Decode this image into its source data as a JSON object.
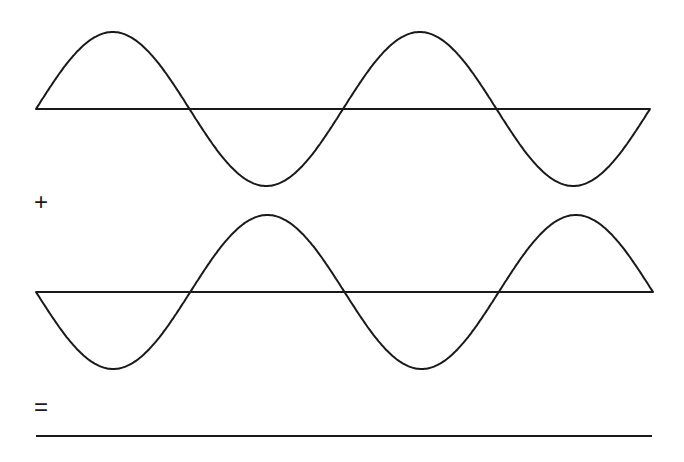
{
  "diagram": {
    "operators": {
      "plus": "+",
      "equals": "="
    },
    "wave1": {
      "label": "wave-in-phase",
      "axis_y": 109,
      "x_start": 36,
      "x_end": 650,
      "amplitude": 77,
      "cycles": 2,
      "phase": "positive"
    },
    "wave2": {
      "label": "wave-inverted",
      "axis_y": 292,
      "x_start": 36,
      "x_end": 653,
      "amplitude": 77,
      "cycles": 2,
      "phase": "negative"
    },
    "result": {
      "label": "flat-line-sum",
      "y": 436,
      "x_start": 36,
      "x_end": 652
    },
    "colors": {
      "stroke": "#1a1a1a",
      "background": "#ffffff"
    }
  }
}
